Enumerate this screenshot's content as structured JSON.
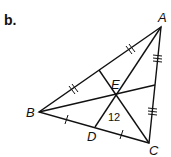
{
  "part_label": "b.",
  "vertices": {
    "A": {
      "label": "A",
      "x": 161,
      "y": 27
    },
    "B": {
      "label": "B",
      "x": 39,
      "y": 112
    },
    "C": {
      "label": "C",
      "x": 149,
      "y": 143
    },
    "D": {
      "label": "D",
      "x": 95,
      "y": 127
    },
    "E": {
      "label": "E",
      "x": 116,
      "y": 95
    }
  },
  "segment_value": "12",
  "colors": {
    "stroke": "#111111",
    "background": "#ffffff"
  }
}
